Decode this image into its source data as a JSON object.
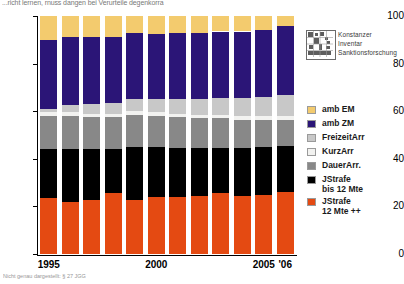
{
  "caption_top": "...richt lernen, rnuss dangen bei Verurteile degenkorra",
  "footnote": "Nicht genau dargestellt: § 27 JGG",
  "logo": {
    "mark_name": "konstanz-inventar-logo",
    "line1": "Konstanzer",
    "line2": "Inventar",
    "line3": "Sanktionsforschung"
  },
  "legend": {
    "items": [
      {
        "label": "amb EM",
        "label2": "",
        "color": "#f3cb6e",
        "key": "ambem"
      },
      {
        "label": "amb ZM",
        "label2": "",
        "color": "#2b1577",
        "key": "ambzm"
      },
      {
        "label": "FreizeitArr",
        "label2": "",
        "color": "#c8c8c8",
        "key": "freizeit"
      },
      {
        "label": "KurzArr",
        "label2": "",
        "color": "#f2f2f0",
        "key": "kurz"
      },
      {
        "label": "DauerArr.",
        "label2": "",
        "color": "#888888",
        "key": "dauer"
      },
      {
        "label": "JStrafe",
        "label2": "bis 12 Mte",
        "color": "#000000",
        "key": "jstrafe12"
      },
      {
        "label": "JStrafe",
        "label2": "12 Mte ++",
        "color": "#e44a12",
        "key": "jstrafe12pp"
      }
    ]
  },
  "chart_data": {
    "type": "bar",
    "stacked": true,
    "stack_total": 100,
    "title": "",
    "xlabel": "",
    "ylabel": "",
    "ylim": [
      0,
      100
    ],
    "yticks": [
      0,
      20,
      40,
      60,
      80,
      100
    ],
    "grid": false,
    "legend_position": "right",
    "categories": [
      "1995",
      "1996",
      "1997",
      "1998",
      "1999",
      "2000",
      "2001",
      "2002",
      "2003",
      "2004",
      "2005",
      "'06"
    ],
    "xtick_labels": [
      "1995",
      "2000",
      "2005",
      "'06"
    ],
    "xtick_categories": [
      "1995",
      "2000",
      "2005",
      "'06"
    ],
    "series": [
      {
        "name": "JStrafe 12 Mte ++",
        "color": "#e44a12",
        "values": [
          23.5,
          22.0,
          22.5,
          25.5,
          22.5,
          24.0,
          24.0,
          24.5,
          25.5,
          24.5,
          25.0,
          26.0
        ]
      },
      {
        "name": "JStrafe bis 12 Mte",
        "color": "#000000",
        "values": [
          20.5,
          22.0,
          21.5,
          18.5,
          22.5,
          21.0,
          20.5,
          20.0,
          19.0,
          20.0,
          20.0,
          19.5
        ]
      },
      {
        "name": "DauerArr.",
        "color": "#888888",
        "values": [
          14.0,
          14.0,
          13.5,
          13.5,
          13.5,
          13.0,
          13.0,
          12.5,
          12.5,
          12.0,
          11.5,
          11.0
        ]
      },
      {
        "name": "KurzArr",
        "color": "#f2f2f0",
        "values": [
          1.5,
          1.5,
          1.5,
          1.5,
          1.5,
          1.5,
          1.5,
          1.5,
          1.5,
          1.5,
          1.5,
          1.5
        ]
      },
      {
        "name": "FreizeitArr",
        "color": "#c8c8c8",
        "values": [
          1.5,
          3.0,
          4.0,
          4.5,
          5.0,
          5.5,
          6.0,
          6.5,
          7.0,
          7.5,
          8.0,
          9.0
        ]
      },
      {
        "name": "amb ZM",
        "color": "#2b1577",
        "values": [
          29.0,
          28.5,
          28.0,
          27.5,
          28.0,
          27.5,
          28.0,
          28.0,
          28.0,
          28.0,
          28.0,
          29.0
        ]
      },
      {
        "name": "amb EM",
        "color": "#f3cb6e",
        "values": [
          10.0,
          9.0,
          9.0,
          9.0,
          7.0,
          7.5,
          7.0,
          7.0,
          6.5,
          6.5,
          6.0,
          4.0
        ]
      }
    ]
  }
}
